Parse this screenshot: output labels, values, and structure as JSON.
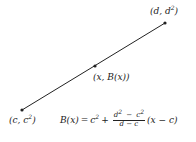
{
  "diagram": {
    "segment": {
      "start": {
        "x": 22,
        "y": 110
      },
      "end": {
        "x": 165,
        "y": 23
      },
      "mid": {
        "x": 95,
        "y": 66
      },
      "color": "#222222"
    },
    "labels": {
      "end_point": {
        "pre": "(d, d",
        "sup": "2",
        "post": ")"
      },
      "mid_point": "(x, B(x))",
      "start_point": {
        "pre": "(c, c",
        "sup": "2",
        "post": ")"
      }
    },
    "formula": {
      "lhs": "B(x)",
      "eq": "=",
      "term1_base": "c",
      "term1_sup": "2",
      "plus": "+",
      "frac_num": {
        "a": "d",
        "a_sup": "2",
        "minus": "−",
        "b": "c",
        "b_sup": "2"
      },
      "frac_den": "d − c",
      "tail": "(x − c)"
    }
  }
}
